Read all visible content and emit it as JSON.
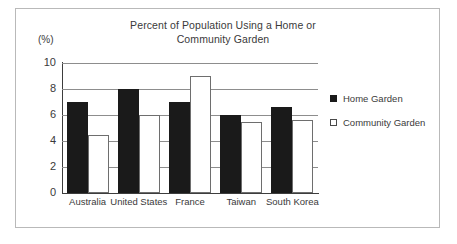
{
  "chart_data": {
    "type": "bar",
    "title": "Percent of Population Using a Home or Community Garden",
    "title_line1": "Percent of Population Using a Home or",
    "title_line2": "Community Garden",
    "xlabel": "",
    "ylabel": "(%)",
    "ylim": [
      0,
      10
    ],
    "ytick_step": 2,
    "yticks": [
      10,
      8,
      6,
      4,
      2,
      0
    ],
    "grid": true,
    "legend_position": "right",
    "categories": [
      "Australia",
      "United States",
      "France",
      "Taiwan",
      "South Korea"
    ],
    "series": [
      {
        "name": "Home Garden",
        "color": "#1a1a1a",
        "style": "filled",
        "values": [
          7,
          8,
          7,
          6,
          6.6
        ]
      },
      {
        "name": "Community Garden",
        "color": "#ffffff",
        "style": "hollow",
        "values": [
          4.5,
          6,
          9,
          5.5,
          5.6
        ]
      }
    ]
  },
  "legend": {
    "items": [
      {
        "label": "Home Garden",
        "style": "filled"
      },
      {
        "label": "Community Garden",
        "style": "hollow"
      }
    ]
  }
}
